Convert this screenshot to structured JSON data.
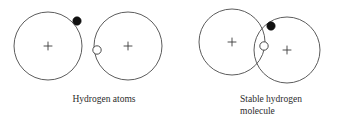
{
  "figure": {
    "background_color": "#ffffff",
    "stroke_color": "#4a4a4a",
    "electron_filled_color": "#111111",
    "electron_open_fill": "#ffffff",
    "nucleus_symbol": "+",
    "groups": [
      {
        "id": "hydrogen-atoms",
        "caption": "Hydrogen atoms",
        "atoms": [
          {
            "id": "atom-left",
            "shell": {
              "cx": 48,
              "cy": 46,
              "r": 34
            },
            "nucleus": {
              "cx": 48,
              "cy": 46,
              "label": "+"
            },
            "electron": {
              "cx": 77,
              "cy": 21,
              "r": 4.2,
              "type": "filled"
            }
          },
          {
            "id": "atom-right",
            "shell": {
              "cx": 128,
              "cy": 46,
              "r": 34
            },
            "nucleus": {
              "cx": 128,
              "cy": 46,
              "label": "+"
            },
            "electron": {
              "cx": 97,
              "cy": 50,
              "r": 4.2,
              "type": "open"
            }
          }
        ]
      },
      {
        "id": "stable-hydrogen-molecule",
        "caption": "Stable hydrogen\nmolecule",
        "caption_lines": [
          "Stable hydrogen",
          "molecule"
        ],
        "atoms": [
          {
            "id": "molecule-atom-left",
            "shell": {
              "cx": 232,
              "cy": 42,
              "r": 33
            },
            "nucleus": {
              "cx": 232,
              "cy": 42,
              "label": "+"
            }
          },
          {
            "id": "molecule-atom-right",
            "shell": {
              "cx": 287,
              "cy": 50,
              "r": 33
            },
            "nucleus": {
              "cx": 287,
              "cy": 50,
              "label": "+"
            }
          }
        ],
        "shared_electrons": [
          {
            "id": "shared-electron-filled",
            "cx": 271,
            "cy": 26,
            "r": 4.2,
            "type": "filled"
          },
          {
            "id": "shared-electron-open",
            "cx": 264,
            "cy": 46,
            "r": 4.2,
            "type": "open"
          }
        ]
      }
    ]
  }
}
